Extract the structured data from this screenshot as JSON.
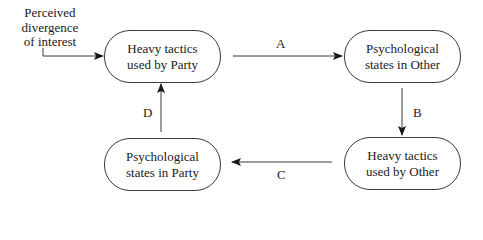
{
  "diagram": {
    "input": {
      "lines": [
        "Perceived",
        "divergence",
        "of interest"
      ]
    },
    "nodes": [
      {
        "id": "heavy-party",
        "lines": [
          "Heavy tactics",
          "used by Party"
        ]
      },
      {
        "id": "psych-other",
        "lines": [
          "Psychological",
          "states in Other"
        ]
      },
      {
        "id": "heavy-other",
        "lines": [
          "Heavy tactics",
          "used by Other"
        ]
      },
      {
        "id": "psych-party",
        "lines": [
          "Psychological",
          "states in Party"
        ]
      }
    ],
    "edges": [
      {
        "label": "A",
        "from": "heavy-party",
        "to": "psych-other"
      },
      {
        "label": "B",
        "from": "psych-other",
        "to": "heavy-other"
      },
      {
        "label": "C",
        "from": "heavy-other",
        "to": "psych-party"
      },
      {
        "label": "D",
        "from": "psych-party",
        "to": "heavy-party"
      }
    ],
    "colors": {
      "stroke": "#3a3a3a",
      "text": "#1a1a1a",
      "background": "#ffffff"
    }
  }
}
